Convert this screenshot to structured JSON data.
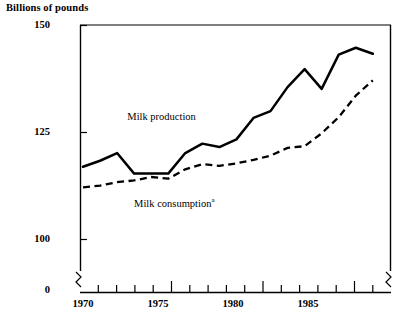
{
  "chart_data": {
    "type": "line",
    "title": "Billions of pounds",
    "xlabel": "",
    "ylabel": "Billions of pounds",
    "grid": false,
    "legend_position": "inline-annotation",
    "x": [
      1970,
      1971,
      1972,
      1973,
      1974,
      1975,
      1976,
      1977,
      1978,
      1979,
      1980,
      1981,
      1982,
      1983,
      1984,
      1985,
      1986,
      1987
    ],
    "xlim": [
      1970,
      1987
    ],
    "ylim": [
      95,
      150
    ],
    "y_axis_break": true,
    "y_break_label": "0",
    "ytick_labels": [
      "150",
      "125",
      "100",
      "0"
    ],
    "yticks": [
      150,
      125,
      100
    ],
    "xtick_labels": [
      "1970",
      "1975",
      "1980",
      "1985"
    ],
    "xticks_major": [
      1970,
      1975,
      1980,
      1985
    ],
    "xticks_minor_every": 1,
    "series": [
      {
        "name": "Milk production",
        "style": "solid",
        "color": "#000000",
        "label_x": 1972.6,
        "label_y": 128.5,
        "values": [
          117.0,
          118.4,
          120.2,
          115.4,
          115.4,
          115.4,
          120.2,
          122.4,
          121.6,
          123.4,
          128.4,
          130.0,
          135.6,
          139.8,
          135.2,
          143.2,
          144.8,
          143.4
        ]
      },
      {
        "name": "Milk consumption",
        "style": "dashed",
        "color": "#000000",
        "footnote_marker": "a",
        "label_x": 1973.0,
        "label_y": 108.6,
        "values": [
          112.2,
          112.6,
          113.4,
          113.8,
          114.6,
          114.2,
          116.4,
          117.6,
          117.2,
          117.8,
          118.6,
          119.6,
          121.4,
          121.8,
          124.8,
          128.6,
          133.6,
          137.2
        ]
      }
    ]
  },
  "labels": {
    "y_axis_caption": "Billions of pounds",
    "series_production": "Milk production",
    "series_consumption": "Milk consumption",
    "consumption_footnote": "a",
    "ytick_150": "150",
    "ytick_125": "125",
    "ytick_100": "100",
    "ytick_zero": "0",
    "xtick_1970": "1970",
    "xtick_1975": "1975",
    "xtick_1980": "1980",
    "xtick_1985": "1985"
  }
}
